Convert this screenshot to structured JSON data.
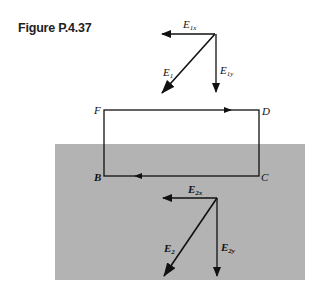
{
  "figure": {
    "label": "Figure P.4.37"
  },
  "diagram": {
    "loop_points": {
      "F": "F",
      "D": "D",
      "B": "B",
      "C": "C"
    },
    "upper_vectors": {
      "E1": "E",
      "E1_sub": "1",
      "E1x": "E",
      "E1x_sub": "1x",
      "E1y": "E",
      "E1y_sub": "1y"
    },
    "lower_vectors": {
      "E2": "E",
      "E2_sub": "2",
      "E2x": "E",
      "E2x_sub": "2x",
      "E2y": "E",
      "E2y_sub": "2y"
    },
    "shaded_region_color": "#b3b3b3",
    "line_color": "#111111"
  }
}
